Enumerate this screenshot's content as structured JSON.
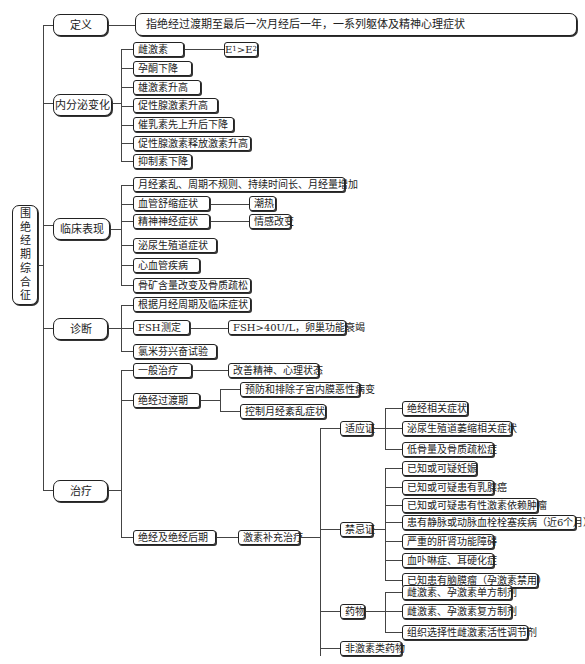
{
  "root": {
    "label": "围绝经期综合征",
    "chars": [
      "围",
      "绝",
      "经",
      "期",
      "综",
      "合",
      "征"
    ]
  },
  "branches": {
    "definition": {
      "label": "定义",
      "text": "指绝经过渡期至最后一次月经后一年，一系列躯体及精神心理症状"
    },
    "endocrine": {
      "label": "内分泌变化",
      "items": [
        "雌激素",
        "孕酮下降",
        "雄激素升高",
        "促性腺激素升高",
        "催乳素先上升后下降",
        "促性腺激素释放激素升高",
        "抑制素下降"
      ],
      "estrogen_note": {
        "e1": "E",
        "s1": "1",
        "op": ">",
        "e2": "E",
        "s2": "2"
      }
    },
    "clinical": {
      "label": "临床表现",
      "items": [
        "月经紊乱、周期不规则、持续时间长、月经量增加",
        "血管舒缩症状",
        "精神神经症状",
        "泌尿生殖道症状",
        "心血管疾病",
        "骨矿含量改变及骨质疏松"
      ],
      "vasomotor_sub": "潮热",
      "neuro_sub": "情感改变"
    },
    "diagnosis": {
      "label": "诊断",
      "items": [
        "根据月经周期及临床症状",
        "FSH测定",
        "氯米芬兴奋试验"
      ],
      "fsh_sub": "FSH>40U/L，卵巢功能衰竭"
    },
    "treatment": {
      "label": "治疗",
      "general": {
        "label": "一般治疗",
        "sub": "改善精神、心理状态"
      },
      "transition": {
        "label": "绝经过渡期",
        "subs": [
          "预防和排除子宫内膜恶性病变",
          "控制月经紊乱症状"
        ]
      },
      "postmenopause": {
        "label": "绝经及绝经后期",
        "hrt": "激素补充治疗",
        "indications": {
          "label": "适应证",
          "items": [
            "绝经相关症状",
            "泌尿生殖道萎缩相关症状",
            "低骨量及骨质疏松症"
          ]
        },
        "contraindications": {
          "label": "禁忌证",
          "items": [
            "已知或可疑妊娠",
            "已知或可疑患有乳腺癌",
            "已知或可疑患有性激素依赖肿瘤",
            "患有静脉或动脉血栓栓塞疾病（近6个月）",
            "严重的肝肾功能障碍",
            "血卟啉症、耳硬化症",
            "已知患有脑膜瘤（孕激素禁用）"
          ]
        },
        "drugs": {
          "label": "药物",
          "items": [
            "雌激素、孕激素单方制剂",
            "雌激素、孕激素复方制剂",
            "组织选择性雌激素活性调节剂"
          ]
        },
        "non_hormonal": "非激素类药物"
      }
    }
  }
}
